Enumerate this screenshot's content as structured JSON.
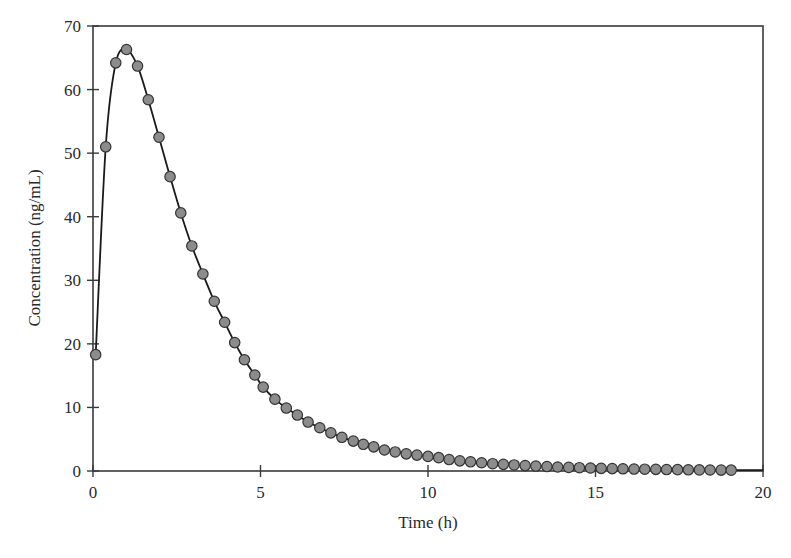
{
  "chart_data": {
    "type": "line",
    "title": "",
    "xlabel": "Time (h)",
    "ylabel": "Concentration (ng/mL)",
    "xlim": [
      0,
      20
    ],
    "ylim": [
      0,
      70
    ],
    "xticks": [
      0,
      5,
      10,
      15,
      20
    ],
    "yticks": [
      0,
      10,
      20,
      30,
      40,
      50,
      60,
      70
    ],
    "xtick_labels": [
      "0",
      "5",
      "10",
      "15",
      "20"
    ],
    "ytick_labels": [
      "0",
      "10",
      "20",
      "30",
      "40",
      "50",
      "60",
      "70"
    ],
    "grid": false,
    "legend": null,
    "series": [
      {
        "name": "Concentration",
        "style": "line-with-markers",
        "line_color": "#1a1a1a",
        "marker_fill": "#8c8c8c",
        "marker_edge": "#333333",
        "x": [
          0.08,
          0.38,
          0.68,
          1.0,
          1.33,
          1.65,
          1.97,
          2.3,
          2.62,
          2.95,
          3.28,
          3.62,
          3.93,
          4.23,
          4.52,
          4.83,
          5.08,
          5.43,
          5.77,
          6.1,
          6.42,
          6.77,
          7.1,
          7.43,
          7.77,
          8.07,
          8.38,
          8.7,
          9.02,
          9.35,
          9.67,
          10.0,
          10.32,
          10.63,
          10.95,
          11.27,
          11.6,
          11.93,
          12.25,
          12.57,
          12.9,
          13.22,
          13.55,
          13.87,
          14.2,
          14.52,
          14.85,
          15.17,
          15.5,
          15.82,
          16.15,
          16.47,
          16.8,
          17.12,
          17.45,
          17.77,
          18.1,
          18.42,
          18.75,
          19.05
        ],
        "y": [
          18.3,
          51.0,
          64.2,
          66.3,
          63.7,
          58.4,
          52.5,
          46.3,
          40.6,
          35.4,
          31.0,
          26.7,
          23.4,
          20.2,
          17.5,
          15.1,
          13.2,
          11.3,
          9.9,
          8.8,
          7.7,
          6.8,
          6.0,
          5.3,
          4.7,
          4.2,
          3.8,
          3.3,
          3.0,
          2.7,
          2.5,
          2.3,
          2.1,
          1.8,
          1.6,
          1.45,
          1.3,
          1.15,
          1.05,
          0.95,
          0.85,
          0.78,
          0.7,
          0.63,
          0.57,
          0.52,
          0.47,
          0.42,
          0.38,
          0.35,
          0.31,
          0.28,
          0.26,
          0.23,
          0.21,
          0.19,
          0.17,
          0.16,
          0.14,
          0.13
        ]
      }
    ]
  },
  "plot": {
    "left": 93,
    "right": 763,
    "top": 26,
    "bottom": 471
  }
}
